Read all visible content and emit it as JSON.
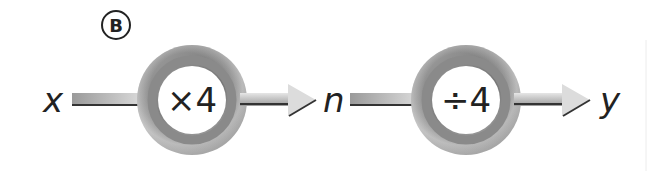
{
  "label": "B",
  "input_var": "x",
  "middle_var": "n",
  "output_var": "y",
  "machines": [
    {
      "operation": "×4"
    },
    {
      "operation": "÷4"
    }
  ],
  "colors": {
    "ring_outer": "#d4d4d4",
    "ring_inner": "#8e8e8e",
    "arrow_shaft": "#c8c8c8",
    "arrow_edge": "#333333",
    "text": "#222222"
  }
}
